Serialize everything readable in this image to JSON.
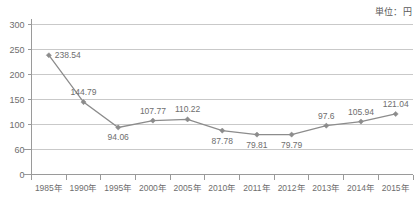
{
  "unit_note": "単位：円",
  "chart_data": {
    "type": "line",
    "title": "",
    "subtitle": "",
    "xlabel": "",
    "ylabel": "",
    "unit": "単位：円",
    "grid": true,
    "legend": "none",
    "ylim": [
      0,
      300
    ],
    "ytick_labels": [
      "300",
      "250",
      "200",
      "150",
      "100",
      "60",
      "0"
    ],
    "ytick_values": [
      300,
      250,
      200,
      150,
      100,
      50,
      0
    ],
    "categories": [
      "1985年",
      "1990年",
      "1995年",
      "2000年",
      "2005年",
      "2010年",
      "2011年",
      "2012年",
      "2013年",
      "2014年",
      "2015年"
    ],
    "values": [
      238.54,
      144.79,
      94.06,
      107.77,
      110.22,
      87.78,
      79.81,
      79.79,
      97.6,
      105.94,
      121.04
    ],
    "point_labels": [
      "238.54",
      "144.79",
      "94.06",
      "107.77",
      "110.22",
      "87.78",
      "79.81",
      "79.79",
      "97.6",
      "105.94",
      "121.04"
    ],
    "label_positions": [
      "right",
      "above",
      "below",
      "above",
      "above",
      "below",
      "below",
      "below",
      "above",
      "above",
      "above"
    ],
    "series_color": "#8c8c8c",
    "grid_color": "#c9c9c9",
    "axis_color": "#9a9a9a",
    "marker": "diamond"
  }
}
